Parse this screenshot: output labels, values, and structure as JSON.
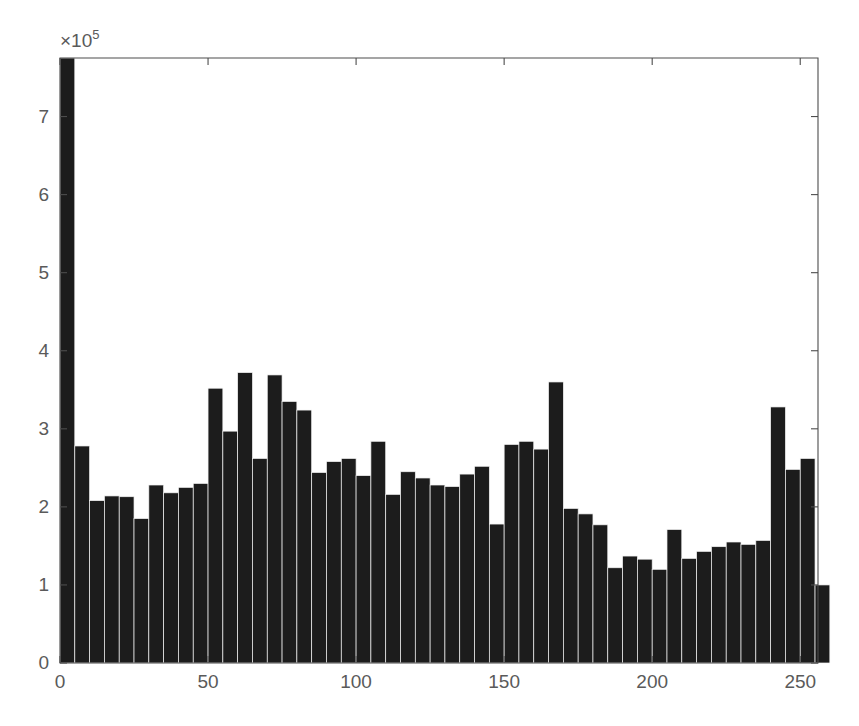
{
  "chart_data": {
    "type": "bar",
    "title": "",
    "subtitle": "",
    "xlabel": "",
    "ylabel": "",
    "y_multiplier_text": "×10",
    "y_multiplier_exponent": "5",
    "y_multiplier_value": 100000,
    "grid": false,
    "legend": null,
    "xlim": [
      0,
      256
    ],
    "ylim": [
      0,
      7.75
    ],
    "xticks": [
      0,
      50,
      100,
      150,
      200,
      250
    ],
    "xtick_labels": [
      "0",
      "50",
      "100",
      "150",
      "200",
      "250"
    ],
    "yticks": [
      0,
      1,
      2,
      3,
      4,
      5,
      6,
      7
    ],
    "ytick_labels": [
      "0",
      "1",
      "2",
      "3",
      "4",
      "5",
      "6",
      "7"
    ],
    "bin_width": 5,
    "bin_count": 52,
    "x": [
      0,
      5,
      10,
      15,
      20,
      25,
      30,
      35,
      40,
      45,
      50,
      55,
      60,
      65,
      70,
      75,
      80,
      85,
      90,
      95,
      100,
      105,
      110,
      115,
      120,
      125,
      130,
      135,
      140,
      145,
      150,
      155,
      160,
      165,
      170,
      175,
      180,
      185,
      190,
      195,
      200,
      205,
      210,
      215,
      220,
      225,
      230,
      235,
      240,
      245,
      250,
      255
    ],
    "categories": [
      "0-5",
      "5-10",
      "10-15",
      "15-20",
      "20-25",
      "25-30",
      "30-35",
      "35-40",
      "40-45",
      "45-50",
      "50-55",
      "55-60",
      "60-65",
      "65-70",
      "70-75",
      "75-80",
      "80-85",
      "85-90",
      "90-95",
      "95-100",
      "100-105",
      "105-110",
      "110-115",
      "115-120",
      "120-125",
      "125-130",
      "130-135",
      "135-140",
      "140-145",
      "145-150",
      "150-155",
      "155-160",
      "160-165",
      "165-170",
      "170-175",
      "175-180",
      "180-185",
      "185-190",
      "190-195",
      "195-200",
      "200-205",
      "205-210",
      "210-215",
      "215-220",
      "220-225",
      "225-230",
      "230-235",
      "235-240",
      "240-245",
      "245-250",
      "250-255",
      "255-260"
    ],
    "values": [
      7.75,
      2.78,
      2.08,
      2.14,
      2.13,
      1.85,
      2.28,
      2.18,
      2.25,
      2.3,
      3.52,
      2.97,
      3.72,
      2.62,
      3.69,
      3.35,
      3.24,
      2.44,
      2.58,
      2.62,
      2.4,
      2.84,
      2.16,
      2.45,
      2.37,
      2.28,
      2.26,
      2.42,
      2.52,
      1.78,
      2.8,
      2.84,
      2.74,
      3.6,
      1.98,
      1.91,
      1.77,
      1.22,
      1.37,
      1.33,
      1.2,
      1.71,
      1.34,
      1.43,
      1.49,
      1.55,
      1.52,
      1.57,
      3.28,
      2.48,
      2.62,
      1.0
    ],
    "units": "counts (×10⁵)"
  },
  "style": {
    "bar_color": "#1c1c1c",
    "bar_edge_color": "#f2f2f2",
    "axis_color": "#4d4d4d",
    "tick_label_color": "#5a5a5a",
    "background_color": "#ffffff"
  },
  "plot_geometry": {
    "left": 60,
    "right": 818,
    "top": 58,
    "bottom": 663
  }
}
